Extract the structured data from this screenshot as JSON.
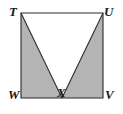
{
  "figure": {
    "name": "square-with-inscribed-inverted-triangle",
    "colors": {
      "background": "#ffffff",
      "shaded_region": "#b4b4b4",
      "unshaded_region": "#ffffff",
      "stroke": "#2b2b2b",
      "label_text": "#1a1a1a"
    },
    "stroke_width": 1.1,
    "square": {
      "left": 21,
      "top": 13,
      "right": 103,
      "bottom": 98
    },
    "points": {
      "T": {
        "x": 21,
        "y": 13
      },
      "U": {
        "x": 103,
        "y": 13
      },
      "V": {
        "x": 103,
        "y": 98
      },
      "W": {
        "x": 21,
        "y": 98
      },
      "X": {
        "x": 62,
        "y": 98
      }
    },
    "paths": {
      "square_outline": "M 21 13 L 103 13 L 103 98 L 21 98 Z",
      "shaded_left_triangle": "M 21 13 L 62 98 L 21 98 Z",
      "shaded_right_triangle": "M 103 13 L 103 98 L 62 98 Z",
      "white_triangle": "M 21 13 L 103 13 L 62 98 Z",
      "segment_TX": "M 21 13 L 62 98",
      "segment_UX": "M 103 13 L 62 98"
    },
    "labels": {
      "T": "T",
      "U": "U",
      "V": "V",
      "W": "W",
      "X": "X"
    }
  }
}
